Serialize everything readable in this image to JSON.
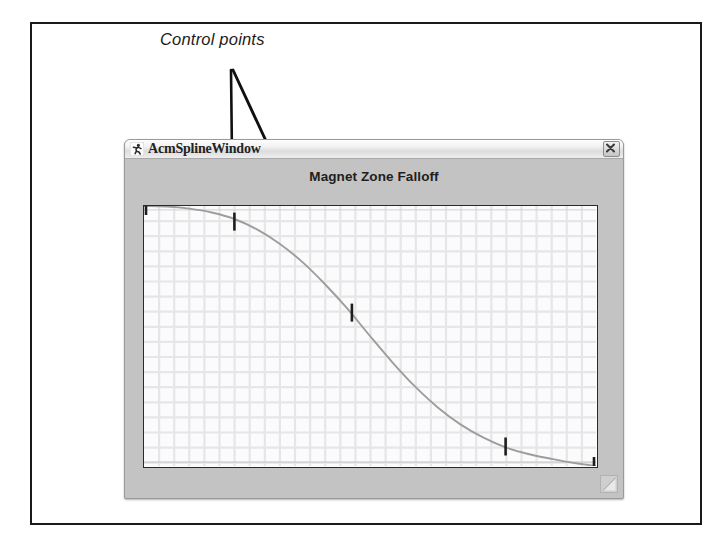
{
  "figure": {
    "caption_remnant": "",
    "annotation": {
      "label": "Control points",
      "leader_lines": [
        {
          "x1": 231,
          "y1": 70,
          "x2": 233,
          "y2": 243
        },
        {
          "x1": 233,
          "y1": 70,
          "x2": 353,
          "y2": 328
        }
      ]
    }
  },
  "window": {
    "title": "AcmSplineWindow",
    "icon": "running-figure-icon",
    "close_label": "✕",
    "close_icon": "close-icon",
    "resize_grip_icon": "resize-grip-icon",
    "colors": {
      "frame": "#c3c3c3",
      "titlebar_light": "#fdfdfd",
      "titlebar_dark": "#dcdcdc",
      "plot_border": "#2a2a2a",
      "plot_background": "#fbfbfb",
      "grid": "#e6e6ea",
      "curve": "#9a9a9a",
      "control_point": "#1e1e1e",
      "annotation": "#1b1b1b"
    }
  },
  "chart_data": {
    "type": "line",
    "title": "Magnet Zone Falloff",
    "xlabel": "",
    "ylabel": "",
    "xlim": [
      0,
      1
    ],
    "ylim": [
      0,
      1
    ],
    "grid": true,
    "legend": "none",
    "axis_tick_labels": {
      "x": [],
      "y": []
    },
    "series": [
      {
        "name": "falloff-spline",
        "kind": "spline",
        "x": [
          0.0,
          0.05,
          0.1,
          0.15,
          0.2,
          0.25,
          0.3,
          0.35,
          0.4,
          0.45,
          0.5,
          0.55,
          0.6,
          0.65,
          0.7,
          0.75,
          0.8,
          0.85,
          0.9,
          0.95,
          1.0
        ],
        "y": [
          1.0,
          0.998,
          0.99,
          0.975,
          0.95,
          0.91,
          0.855,
          0.785,
          0.7,
          0.605,
          0.5,
          0.398,
          0.305,
          0.225,
          0.16,
          0.11,
          0.072,
          0.046,
          0.028,
          0.012,
          0.0
        ]
      }
    ],
    "control_points": [
      {
        "label": "p0",
        "x": 0.0,
        "y": 1.0
      },
      {
        "label": "p1",
        "x": 0.2,
        "y": 0.94
      },
      {
        "label": "p2",
        "x": 0.46,
        "y": 0.59
      },
      {
        "label": "p3",
        "x": 0.8,
        "y": 0.075
      },
      {
        "label": "p4",
        "x": 1.0,
        "y": 0.0
      }
    ],
    "baseline_y": 0.015,
    "topline_y": 0.985
  }
}
